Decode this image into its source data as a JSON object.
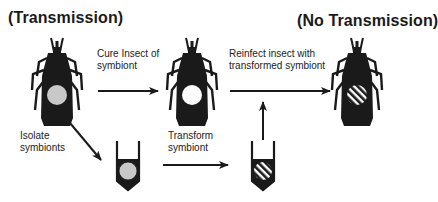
{
  "titles": {
    "left": "(Transmission)",
    "right": "(No Transmission)"
  },
  "steps": [
    {
      "id": "cure",
      "lines": [
        "Cure Insect of",
        "symbiont"
      ]
    },
    {
      "id": "reinfect",
      "lines": [
        "Reinfect insect with",
        "transformed symbiont"
      ]
    },
    {
      "id": "isolate",
      "lines": [
        "Isolate",
        "symbionts"
      ]
    },
    {
      "id": "transform",
      "lines": [
        "Transform",
        "symbiont"
      ]
    }
  ],
  "nodes": [
    {
      "id": "insect-with-symbiont",
      "type": "insect",
      "symbiont": "native-gray"
    },
    {
      "id": "cured-insect",
      "type": "insect",
      "symbiont": "none-white"
    },
    {
      "id": "reinfected-insect",
      "type": "insect",
      "symbiont": "transformed-hatched"
    },
    {
      "id": "isolated-symbiont-tube",
      "type": "tube",
      "symbiont": "native-gray"
    },
    {
      "id": "transformed-symbiont-tube",
      "type": "tube",
      "symbiont": "transformed-hatched"
    }
  ],
  "colors": {
    "ink": "#1a1a1a",
    "native_symbiont": "#c8c8c8",
    "cured": "#ffffff",
    "background": "#ffffff"
  }
}
